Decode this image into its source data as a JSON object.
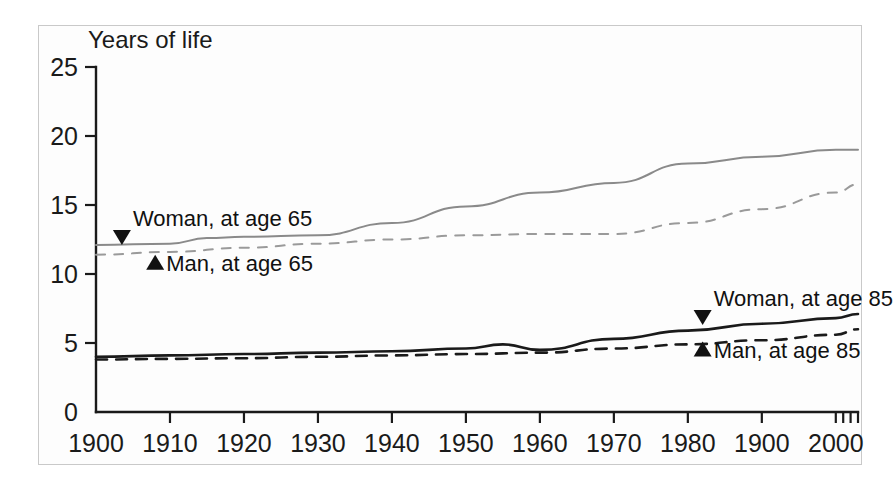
{
  "chart_data": {
    "type": "line",
    "title": "",
    "ylabel": "Years of life",
    "xlabel": "",
    "xlim": [
      1900,
      2003
    ],
    "ylim": [
      0,
      25
    ],
    "grid": false,
    "legend_position": "inline-annotations",
    "y_ticks": [
      "0",
      "5",
      "10",
      "15",
      "20",
      "25"
    ],
    "y_tick_values": [
      0,
      5,
      10,
      15,
      20,
      25
    ],
    "x_ticks": [
      "1900",
      "1910",
      "1920",
      "1930",
      "1940",
      "1950",
      "1960",
      "1970",
      "1980",
      "1900",
      "2000"
    ],
    "x_tick_values": [
      1900,
      1910,
      1920,
      1930,
      1940,
      1950,
      1960,
      1970,
      1980,
      1990,
      2000
    ],
    "x_minor_ticks": [
      2001,
      2002,
      2003
    ],
    "series": [
      {
        "name": "Woman, at age 65",
        "style": "solid",
        "color": "#8a8a8a",
        "marker": "triangle-down",
        "x": [
          1900,
          1910,
          1915,
          1920,
          1930,
          1940,
          1950,
          1960,
          1970,
          1980,
          1990,
          2000,
          2003
        ],
        "values": [
          12.1,
          12.2,
          12.6,
          12.7,
          12.8,
          13.7,
          14.9,
          15.9,
          16.6,
          18.0,
          18.5,
          19.0,
          19.0
        ]
      },
      {
        "name": "Man, at age 65",
        "style": "dashed",
        "color": "#9a9a9a",
        "marker": "triangle-up",
        "x": [
          1900,
          1910,
          1920,
          1930,
          1940,
          1950,
          1960,
          1970,
          1980,
          1990,
          2000,
          2003
        ],
        "values": [
          11.4,
          11.6,
          11.9,
          12.2,
          12.5,
          12.8,
          12.9,
          12.9,
          13.7,
          14.7,
          15.9,
          16.5
        ]
      },
      {
        "name": "Woman, at age 85",
        "style": "solid",
        "color": "#1a1a1a",
        "marker": "triangle-down",
        "x": [
          1900,
          1910,
          1920,
          1930,
          1940,
          1950,
          1955,
          1960,
          1970,
          1980,
          1990,
          2000,
          2003
        ],
        "values": [
          4.0,
          4.1,
          4.2,
          4.3,
          4.4,
          4.6,
          4.9,
          4.5,
          5.3,
          5.9,
          6.4,
          6.8,
          7.1
        ]
      },
      {
        "name": "Man, at age 85",
        "style": "dashed",
        "color": "#1a1a1a",
        "marker": "triangle-up",
        "x": [
          1900,
          1910,
          1920,
          1930,
          1940,
          1950,
          1960,
          1970,
          1980,
          1990,
          2000,
          2003
        ],
        "values": [
          3.8,
          3.85,
          3.9,
          4.0,
          4.1,
          4.2,
          4.3,
          4.6,
          4.9,
          5.2,
          5.6,
          6.0
        ]
      }
    ],
    "annotations": [
      {
        "text": "Woman, at age 65",
        "marker": "triangle-down",
        "x_at": 1903.5,
        "y_at": 12.1
      },
      {
        "text": "Man, at age 65",
        "marker": "triangle-up",
        "x_at": 1908,
        "y_at": 11.4
      },
      {
        "text": "Woman, at age 85",
        "marker": "triangle-down",
        "x_at": 1982,
        "y_at": 6.3
      },
      {
        "text": "Man, at age 85",
        "marker": "triangle-up",
        "x_at": 1982,
        "y_at": 5.1
      }
    ]
  }
}
